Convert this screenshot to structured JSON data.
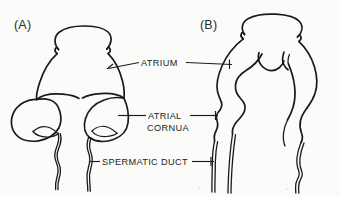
{
  "figure": {
    "background_color": "#fbfbf9",
    "ink_color": "#1a1a1a",
    "panels": [
      {
        "id": "A",
        "label": "(A)"
      },
      {
        "id": "B",
        "label": "(B)"
      }
    ],
    "callouts": [
      {
        "id": "atrium",
        "label": "ATRIUM",
        "lines": [
          "ATRIUM"
        ]
      },
      {
        "id": "atrial-cornua",
        "label": "ATRIAL CORNUA",
        "lines": [
          "ATRIAL",
          "CORNUA"
        ]
      },
      {
        "id": "spermatic-duct",
        "label": "SPERMATIC DUCT",
        "lines": [
          "SPERMATIC DUCT"
        ]
      }
    ],
    "callout_text": {
      "atrium": "ATRIUM",
      "atrial_line1": "ATRIAL",
      "atrial_line2": "CORNUA",
      "spermatic_duct": "SPERMATIC DUCT"
    },
    "panel_a_label": "(A)",
    "panel_b_label": "(B)"
  }
}
